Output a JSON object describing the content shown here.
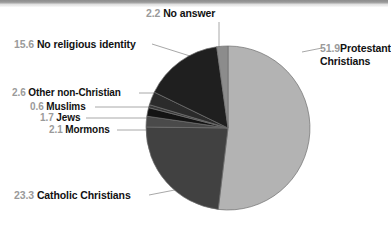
{
  "chart_data": {
    "type": "pie",
    "title": "",
    "subtitle": "",
    "xlabel": "",
    "ylabel": "",
    "legend_position": "none",
    "grid": false,
    "units": "percent",
    "total": 100.0,
    "categories": [
      "Protestant Christians",
      "Catholic Christians",
      "Mormons",
      "Jews",
      "Muslims",
      "Other non-Christian",
      "No religious identity",
      "No answer"
    ],
    "values": [
      51.9,
      23.3,
      2.1,
      1.7,
      0.6,
      2.6,
      15.6,
      2.2
    ],
    "slices": [
      {
        "label": "Protestant Christians",
        "value": 51.9,
        "value_text": "51.9",
        "color": "#b3b3b3",
        "label_lines": [
          "Protestant",
          "Christians"
        ]
      },
      {
        "label": "Catholic Christians",
        "value": 23.3,
        "value_text": "23.3",
        "color": "#414141",
        "label_lines": [
          "Catholic Christians"
        ]
      },
      {
        "label": "Mormons",
        "value": 2.1,
        "value_text": "2.1",
        "color": "#4a4a4a",
        "label_lines": [
          "Mormons"
        ]
      },
      {
        "label": "Jews",
        "value": 1.7,
        "value_text": "1.7",
        "color": "#141414",
        "label_lines": [
          "Jews"
        ]
      },
      {
        "label": "Muslims",
        "value": 0.6,
        "value_text": "0.6",
        "color": "#3a3a3a",
        "label_lines": [
          "Muslims"
        ]
      },
      {
        "label": "Other non-Christian",
        "value": 2.6,
        "value_text": "2.6",
        "color": "#2b2b2b",
        "label_lines": [
          "Other non-Christian"
        ]
      },
      {
        "label": "No religious identity",
        "value": 15.6,
        "value_text": "15.6",
        "color": "#1f1f1f",
        "label_lines": [
          "No religious identity"
        ]
      },
      {
        "label": "No answer",
        "value": 2.2,
        "value_text": "2.2",
        "color": "#8c8c8c",
        "label_lines": [
          "No answer"
        ]
      }
    ],
    "start_angle_deg": 0,
    "direction": "clockwise",
    "geometry": {
      "cx": 228,
      "cy": 128,
      "r": 82
    }
  },
  "labels": {
    "no_answer": {
      "value": "2.2",
      "text": "No answer"
    },
    "no_religious_identity": {
      "value": "15.6",
      "text": "No religious identity"
    },
    "other_non_christian": {
      "value": "2.6",
      "text": "Other non-Christian"
    },
    "muslims": {
      "value": "0.6",
      "text": "Muslims"
    },
    "jews": {
      "value": "1.7",
      "text": "Jews"
    },
    "mormons": {
      "value": "2.1",
      "text": "Mormons"
    },
    "catholic": {
      "value": "23.3",
      "text": "Catholic Christians"
    },
    "protestant": {
      "value": "51.9",
      "line1": "Protestant",
      "line2": "Christians"
    }
  },
  "colors": {
    "protestant": "#b3b3b3",
    "catholic": "#414141",
    "no_religious_identity": "#1f1f1f",
    "no_answer": "#8c8c8c",
    "leader_line": "#a8a8a8",
    "number_text": "#9a9a9a",
    "label_text": "#111111",
    "background": "#ffffff"
  }
}
